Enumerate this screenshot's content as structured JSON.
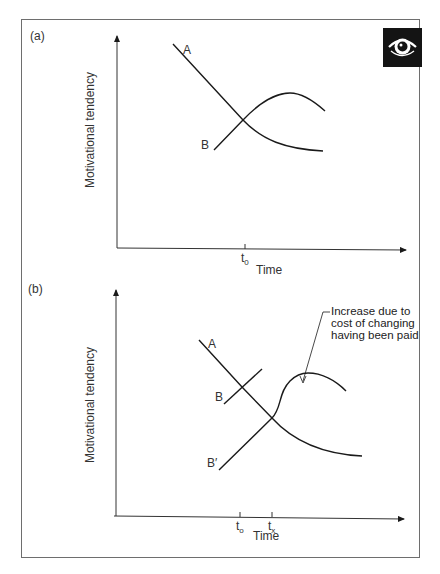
{
  "figure": {
    "panels": [
      {
        "id": "a",
        "label": "(a)",
        "ylabel": "Motivational tendency",
        "xlabel": "Time",
        "ticks": [
          {
            "base": "t",
            "sub": "0"
          }
        ],
        "curves": [
          {
            "name": "A",
            "label": "A",
            "description": "declines, crosses B at t0, levels off low"
          },
          {
            "name": "B",
            "label": "B",
            "description": "rises, crosses A at t0, peaks, then declines"
          }
        ]
      },
      {
        "id": "b",
        "label": "(b)",
        "ylabel": "Motivational tendency",
        "xlabel": "Time",
        "ticks": [
          {
            "base": "t",
            "sub": "o"
          },
          {
            "base": "t",
            "sub": "x"
          }
        ],
        "curves": [
          {
            "name": "A",
            "label": "A",
            "description": "declines steadily across the graph"
          },
          {
            "name": "B",
            "label": "B",
            "description": "short rising segment crossing A at to"
          },
          {
            "name": "B'",
            "label": "B′",
            "description": "rising line crossing A at tx, then sharp rise and peak"
          }
        ],
        "annotation": {
          "lines": [
            "Increase due to",
            "cost of changing",
            "having been paid"
          ]
        }
      }
    ],
    "icon": "eye-icon",
    "colors": {
      "line": "#1a1a1a",
      "frame": "#6e6e6e",
      "badge_bg": "#141414",
      "badge_fg": "#ffffff"
    }
  }
}
